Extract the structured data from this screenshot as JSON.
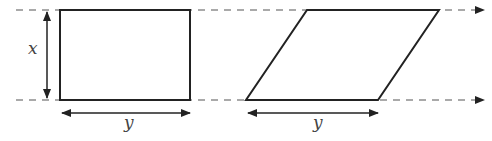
{
  "diagram": {
    "labels": {
      "height": "x",
      "rect_base": "y",
      "para_base": "y"
    },
    "colors": {
      "stroke": "#222222",
      "dash": "#555555",
      "text": "#444444"
    }
  }
}
